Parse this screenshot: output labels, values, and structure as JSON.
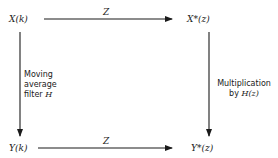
{
  "diagram": {
    "nodes": {
      "top_left": "X(k)",
      "top_right": "X*(z)",
      "bottom_left": "Y(k)",
      "bottom_right": "Y*(z)"
    },
    "edges": {
      "top": {
        "label": "Z",
        "from": "X(k)",
        "to": "X*(z)"
      },
      "bottom": {
        "label": "Z",
        "from": "Y(k)",
        "to": "Y*(z)"
      },
      "left": {
        "from": "X(k)",
        "to": "Y(k)",
        "line1": "Moving",
        "line2": "average",
        "line3_prefix": "filter ",
        "line3_symbol": "H"
      },
      "right": {
        "from": "X*(z)",
        "to": "Y*(z)",
        "line1": "Multiplication",
        "line2_prefix": "by ",
        "line2_symbol": "H(z)"
      }
    },
    "colors": {
      "ink": "#1a1a1a",
      "background": "#ffffff"
    }
  }
}
